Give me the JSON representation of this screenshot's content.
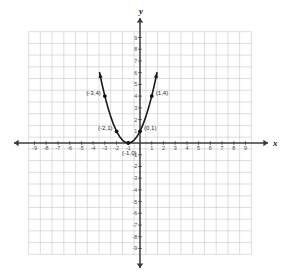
{
  "chart_data": {
    "type": "line",
    "title": "",
    "xlabel": "x",
    "ylabel": "y",
    "grid": true,
    "legend": "none",
    "xlim": [
      -10,
      10
    ],
    "ylim": [
      -10,
      10
    ],
    "x_ticks": [
      -9,
      -8,
      -7,
      -6,
      -5,
      -4,
      -3,
      -2,
      -1,
      1,
      2,
      3,
      4,
      5,
      6,
      7,
      8,
      9
    ],
    "y_ticks": [
      9,
      8,
      7,
      6,
      5,
      4,
      3,
      2,
      1,
      -1,
      -2,
      -3,
      -4,
      -5,
      -6,
      -7,
      -8,
      -9
    ],
    "x_tick_labels": [
      "-9",
      "-8",
      "-7",
      "-6",
      "-5",
      "-4",
      "-3",
      "-2",
      "-1",
      "1",
      "2",
      "3",
      "4",
      "5",
      "6",
      "7",
      "8",
      "9"
    ],
    "y_tick_labels": [
      "9",
      "8",
      "7",
      "6",
      "5",
      "4",
      "3",
      "2",
      "1",
      "-1",
      "-2",
      "-3",
      "-4",
      "-5",
      "-6",
      "-7",
      "-8",
      "-9"
    ],
    "curve": {
      "equation": "y = (x + 1)^2",
      "vertex": [
        -1,
        0
      ],
      "x_range": [
        -3.45,
        1.45
      ],
      "sampled_points": [
        [
          -3.45,
          6.0
        ],
        [
          -3.2,
          4.84
        ],
        [
          -3.0,
          4.0
        ],
        [
          -2.75,
          3.0625
        ],
        [
          -2.5,
          2.25
        ],
        [
          -2.25,
          1.5625
        ],
        [
          -2.0,
          1.0
        ],
        [
          -1.75,
          0.5625
        ],
        [
          -1.5,
          0.25
        ],
        [
          -1.25,
          0.0625
        ],
        [
          -1.0,
          0.0
        ],
        [
          -0.75,
          0.0625
        ],
        [
          -0.5,
          0.25
        ],
        [
          -0.25,
          0.5625
        ],
        [
          0.0,
          1.0
        ],
        [
          0.25,
          1.5625
        ],
        [
          0.5,
          2.25
        ],
        [
          0.75,
          3.0625
        ],
        [
          1.0,
          4.0
        ],
        [
          1.2,
          4.84
        ],
        [
          1.45,
          6.0
        ]
      ]
    },
    "marked_points": [
      {
        "x": -3,
        "y": 4,
        "label": "(-3,4)",
        "label_side": "left"
      },
      {
        "x": -2,
        "y": 1,
        "label": "(-2,1)",
        "label_side": "left"
      },
      {
        "x": -1,
        "y": 0,
        "label": "(-1,0)",
        "label_side": "below"
      },
      {
        "x": 0,
        "y": 1,
        "label": "(0,1)",
        "label_side": "right"
      },
      {
        "x": 1,
        "y": 4,
        "label": "(1,4)",
        "label_side": "right"
      }
    ],
    "colors": {
      "grid": "#c8c8c8",
      "axis": "#3a3a3a",
      "curve": "#1a1a1a",
      "point": "#111111",
      "tick_label": "#4a4a4a",
      "background": "#ffffff"
    }
  }
}
